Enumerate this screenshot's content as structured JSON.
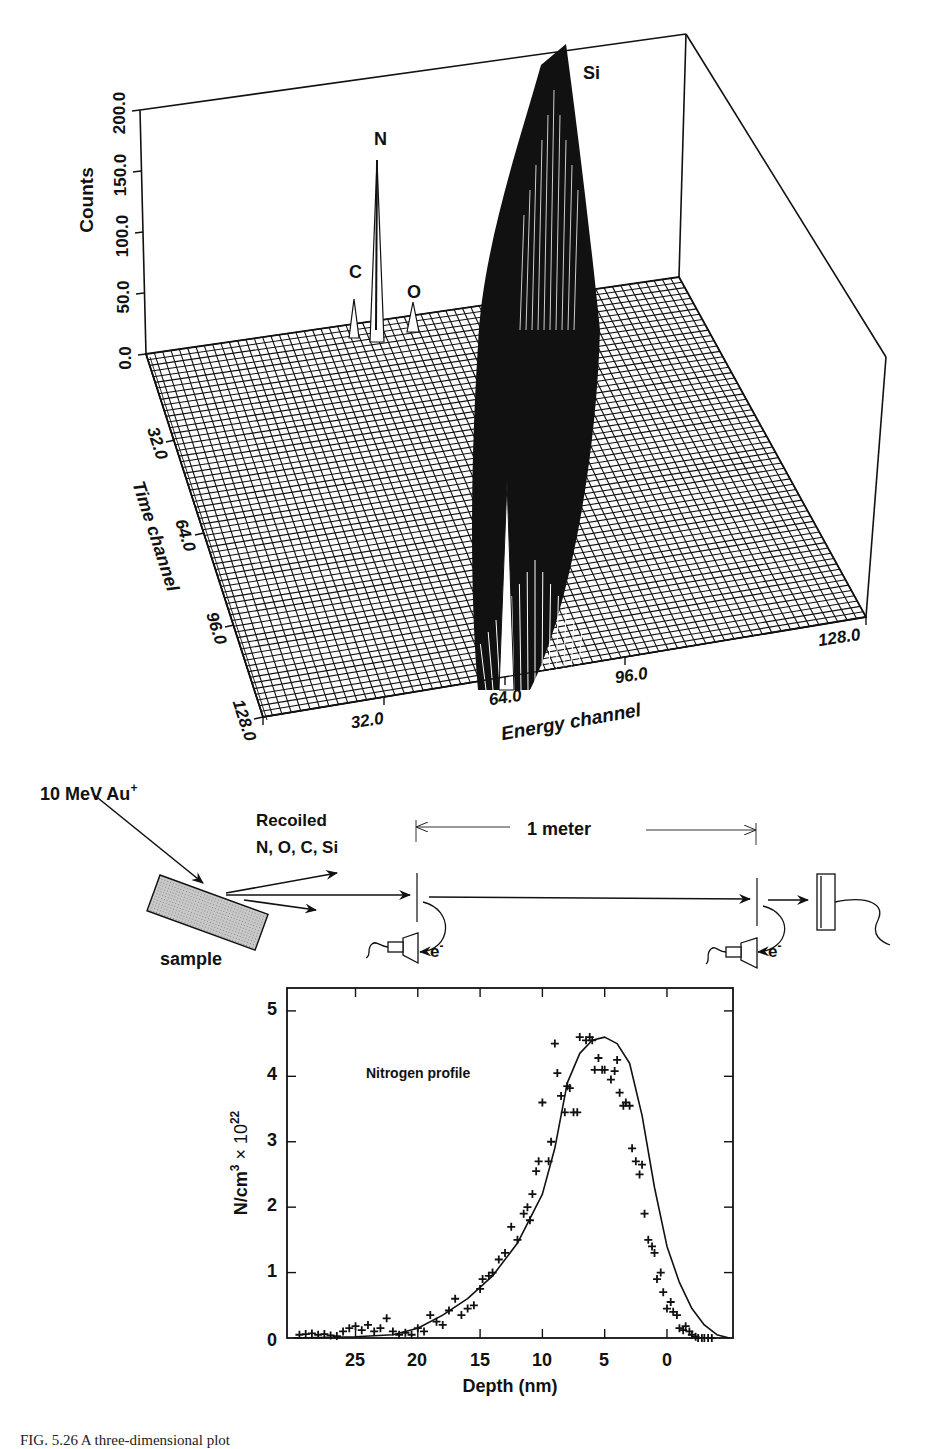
{
  "figure": {
    "caption": "FIG. 5.26  A three-dimensional plot"
  },
  "plot3d": {
    "z_axis_label": "Counts",
    "z_ticks": [
      "0.0",
      "50.0",
      "100.0",
      "150.0",
      "200.0"
    ],
    "time_axis_label": "Time channel",
    "time_ticks": [
      "32.0",
      "64.0",
      "96.0",
      "128.0"
    ],
    "energy_axis_label": "Energy channel",
    "energy_ticks": [
      "32.0",
      "64.0",
      "96.0",
      "128.0"
    ],
    "peak_labels": {
      "c": "C",
      "n": "N",
      "o": "O",
      "si": "Si"
    }
  },
  "schematic": {
    "beam_label": "10 MeV Au",
    "beam_superscript": "+",
    "recoil_label_line1": "Recoiled",
    "recoil_label_line2": "N, O, C, Si",
    "sample_label": "sample",
    "distance_label": "1 meter",
    "electron_label": "e",
    "electron_superscript": "-"
  },
  "profile": {
    "annotation": "Nitrogen profile",
    "ylabel_main": "N/cm",
    "ylabel_sup1": "3",
    "ylabel_times": " × 10",
    "ylabel_sup2": "22",
    "xlabel": "Depth (nm)",
    "x_ticks": [
      "25",
      "20",
      "15",
      "10",
      "5",
      "0"
    ],
    "y_ticks": [
      "0",
      "1",
      "2",
      "3",
      "4",
      "5"
    ]
  },
  "chart_data": [
    {
      "type": "surface3d",
      "title": "",
      "xlabel": "Energy channel",
      "ylabel": "Time channel",
      "zlabel": "Counts",
      "x_range": [
        0,
        128
      ],
      "y_range": [
        0,
        128
      ],
      "z_range": [
        0,
        200
      ],
      "x_ticks": [
        32,
        64,
        96,
        128
      ],
      "y_ticks": [
        0,
        32,
        64,
        96,
        128
      ],
      "z_ticks": [
        0,
        50,
        100,
        150,
        200
      ],
      "peaks": [
        {
          "label": "C",
          "approx_counts": 40
        },
        {
          "label": "N",
          "approx_counts": 150
        },
        {
          "label": "O",
          "approx_counts": 30
        },
        {
          "label": "Si",
          "approx_counts": 200
        }
      ],
      "grid": true
    },
    {
      "type": "scatter",
      "title": "Nitrogen profile",
      "xlabel": "Depth (nm)",
      "ylabel": "N/cm3 × 10^22",
      "xlim": [
        30.5,
        -5.3
      ],
      "ylim": [
        0,
        5.2
      ],
      "x_ticks": [
        25,
        20,
        15,
        10,
        5,
        0
      ],
      "y_ticks": [
        0,
        1,
        2,
        3,
        4,
        5
      ],
      "series": [
        {
          "name": "data",
          "marker": "+",
          "x": [
            29.5,
            29,
            28.5,
            28,
            27.5,
            27,
            26.5,
            26,
            25.5,
            25,
            24.5,
            24,
            23.5,
            23,
            22.5,
            22,
            21.5,
            21,
            20.5,
            20,
            19.5,
            19,
            18.5,
            18,
            17.5,
            17,
            16.5,
            16,
            15.5,
            15,
            14.8,
            14.3,
            14,
            13.5,
            13,
            12.5,
            12,
            11.5,
            11.2,
            11,
            10.8,
            10.5,
            10.3,
            10,
            9.5,
            9.3,
            9,
            8.8,
            8.5,
            8.2,
            8,
            7.8,
            7.5,
            7.2,
            7,
            6.5,
            6.2,
            6,
            5.8,
            5.5,
            5.2,
            5,
            4.5,
            4.2,
            4,
            3.8,
            3.5,
            3.3,
            3,
            2.8,
            2.5,
            2.2,
            2,
            1.8,
            1.5,
            1.2,
            1,
            0.8,
            0.5,
            0.3,
            0,
            -0.3,
            -0.5,
            -0.8,
            -1,
            -1.3,
            -1.5,
            -1.8,
            -2,
            -2.3,
            -2.5,
            -2.8,
            -3,
            -3.3,
            -3.6
          ],
          "y": [
            0.05,
            0.06,
            0.07,
            0.05,
            0.06,
            0.04,
            0.03,
            0.1,
            0.15,
            0.18,
            0.12,
            0.2,
            0.1,
            0.15,
            0.3,
            0.1,
            0.05,
            0.08,
            0.05,
            0.15,
            0.1,
            0.35,
            0.25,
            0.2,
            0.42,
            0.6,
            0.35,
            0.45,
            0.5,
            0.75,
            0.9,
            0.95,
            1.0,
            1.2,
            1.3,
            1.7,
            1.5,
            1.9,
            2.0,
            1.8,
            2.2,
            2.55,
            2.7,
            3.6,
            2.7,
            3.0,
            4.5,
            4.05,
            3.7,
            3.45,
            3.85,
            3.82,
            3.45,
            3.45,
            4.6,
            4.55,
            4.6,
            4.55,
            4.1,
            4.28,
            4.1,
            4.1,
            3.95,
            4.08,
            4.25,
            3.75,
            3.55,
            3.6,
            3.55,
            2.9,
            2.7,
            2.5,
            2.65,
            1.9,
            1.5,
            1.4,
            1.3,
            0.9,
            1.0,
            0.7,
            0.45,
            0.55,
            0.4,
            0.35,
            0.15,
            0.12,
            0.18,
            0.1,
            0.05,
            0.02,
            0.0,
            0.0,
            0.0,
            0.0,
            0.0
          ]
        },
        {
          "name": "fit",
          "style": "line",
          "x": [
            30,
            25,
            22,
            20,
            18,
            16,
            14,
            12,
            10,
            9,
            8,
            7,
            6,
            5,
            4,
            3,
            2,
            1,
            0,
            -1,
            -2,
            -3,
            -4,
            -5
          ],
          "y": [
            0.0,
            0.02,
            0.05,
            0.15,
            0.35,
            0.6,
            0.95,
            1.45,
            2.2,
            2.9,
            3.9,
            4.35,
            4.55,
            4.6,
            4.5,
            4.2,
            3.4,
            2.3,
            1.4,
            0.85,
            0.45,
            0.2,
            0.05,
            0.0
          ]
        }
      ],
      "annotations": [
        "Nitrogen profile"
      ],
      "grid": false
    }
  ]
}
